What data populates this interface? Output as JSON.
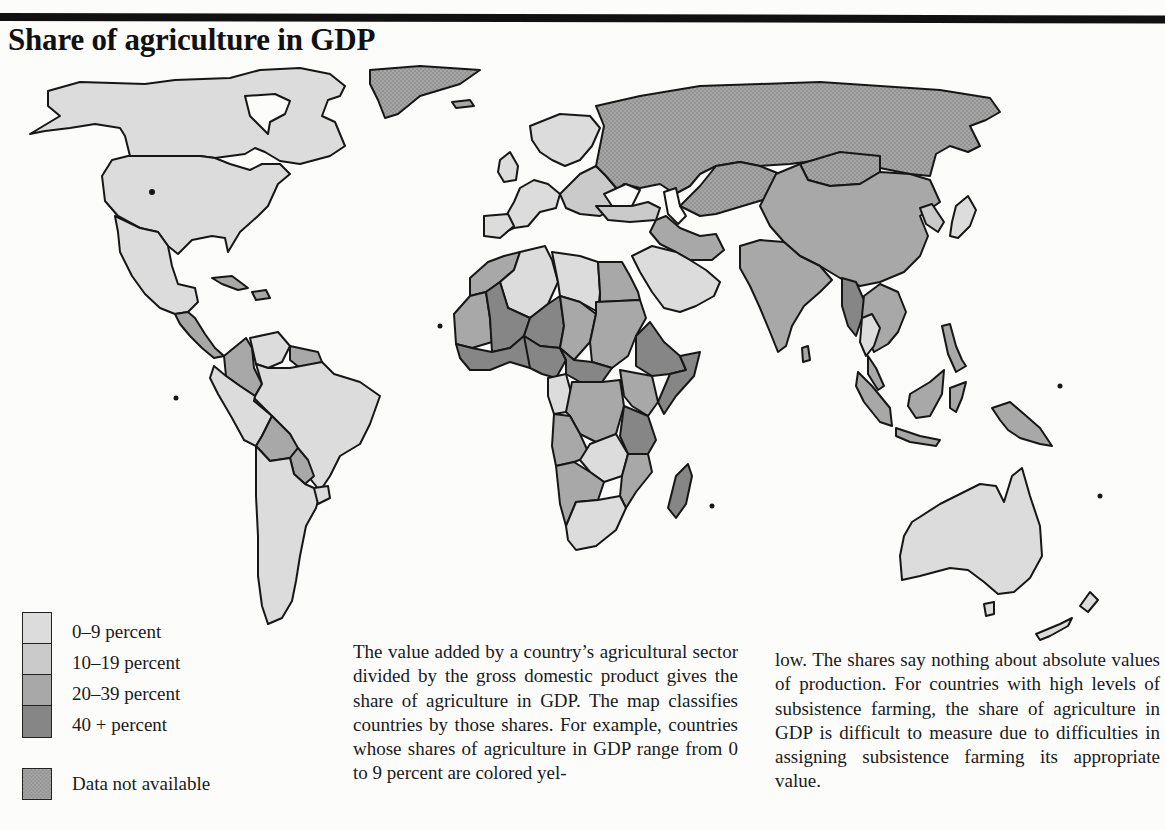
{
  "title": "Share of agriculture in GDP",
  "colors": {
    "page_background": "#fcfcfb",
    "border_lines": "#161616",
    "class_0_9": "#dcdcdc",
    "class_10_19": "#cacaca",
    "class_20_39": "#a8a8a8",
    "class_40_plus": "#868686",
    "data_not_available": "#9e9e9e",
    "water": "#fcfcfb"
  },
  "legend": {
    "items": [
      {
        "label": "0–9 percent",
        "color": "#dcdcdc"
      },
      {
        "label": "10–19 percent",
        "color": "#cacaca"
      },
      {
        "label": "20–39 percent",
        "color": "#a8a8a8"
      },
      {
        "label": "40 + percent",
        "color": "#868686"
      }
    ],
    "na_label": "Data not available",
    "na_color": "#9e9e9e"
  },
  "body_text": {
    "column1": "The value added by a country’s agricul­tural sector divided by the gross domes­tic product gives the share of agriculture in GDP. The map classifies countries by those shares. For example, countries whose shares of agriculture in GDP range from 0 to 9 percent are colored yel-",
    "column2": "low. The shares say nothing about abso­lute values of production. For countries with high levels of subsistence farming, the share of agriculture in GDP is diffi­cult to measure due to difficulties in as­signing subsistence farming its appropri­ate value."
  },
  "map_regions": {
    "north_america": {
      "usa": "0-9",
      "canada": "0-9",
      "mexico": "0-9",
      "greenland": "na",
      "central_america": "20-39",
      "caribbean": "20-39"
    },
    "south_america": {
      "brazil": "0-9",
      "argentina": "0-9",
      "chile": "0-9",
      "peru": "0-9",
      "colombia": "20-39",
      "venezuela": "0-9",
      "bolivia": "20-39",
      "paraguay": "20-39",
      "guianas": "20-39",
      "uruguay": "0-9"
    },
    "europe": {
      "western_europe": "0-9",
      "eastern_europe": "10-19",
      "russia": "na"
    },
    "africa": {
      "north_africa": "10-19",
      "sahel": "40+",
      "central_africa": "20-39",
      "east_africa": "40+",
      "south_africa": "0-9",
      "madagascar": "40+"
    },
    "asia": {
      "china": "20-39",
      "india": "20-39",
      "mongolia": "na",
      "middle_east": "10-19",
      "arabian_peninsula": "0-9",
      "japan": "0-9",
      "southeast_asia": "20-39",
      "myanmar": "40+",
      "indonesia": "20-39"
    },
    "oceania": {
      "australia": "0-9",
      "new_zealand": "0-9",
      "papua_new_guinea": "20-39"
    }
  }
}
